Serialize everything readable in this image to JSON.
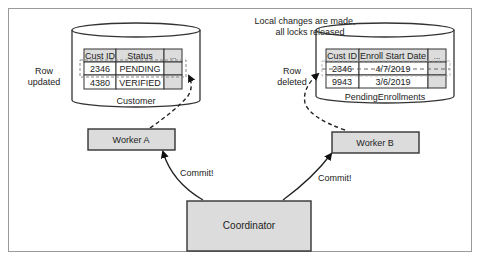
{
  "diagram": {
    "title_note": {
      "line1": "Local changes are made,",
      "line2": "all locks released"
    },
    "customer_db": {
      "name": "Customer",
      "columns": [
        "Cust ID",
        "Status",
        "..."
      ],
      "rows": [
        [
          "2346",
          "PENDING",
          ""
        ],
        [
          "4380",
          "VERIFIED",
          ""
        ]
      ],
      "annotation": {
        "line1": "Row",
        "line2": "updated"
      }
    },
    "pending_db": {
      "name": "PendingEnrollments",
      "columns": [
        "Cust ID",
        "Enroll Start Date",
        "..."
      ],
      "rows": [
        [
          "2346",
          "4/7/2019",
          ""
        ],
        [
          "9943",
          "3/6/2019",
          ""
        ]
      ],
      "annotation": {
        "line1": "Row",
        "line2": "deleted"
      }
    },
    "worker_a": {
      "label": "Worker A"
    },
    "worker_b": {
      "label": "Worker B"
    },
    "coordinator": {
      "label": "Coordinator"
    },
    "edges": [
      {
        "from": "Coordinator",
        "to": "Worker A",
        "label": "Commit!"
      },
      {
        "from": "Coordinator",
        "to": "Worker B",
        "label": "Commit!"
      },
      {
        "from": "Worker A",
        "to": "Customer",
        "style": "dashed"
      },
      {
        "from": "Worker B",
        "to": "PendingEnrollments",
        "style": "dashed"
      }
    ],
    "colors": {
      "box_fill": "#dcdcdc",
      "stroke": "#333333",
      "frame": "#9a9a9a"
    }
  }
}
